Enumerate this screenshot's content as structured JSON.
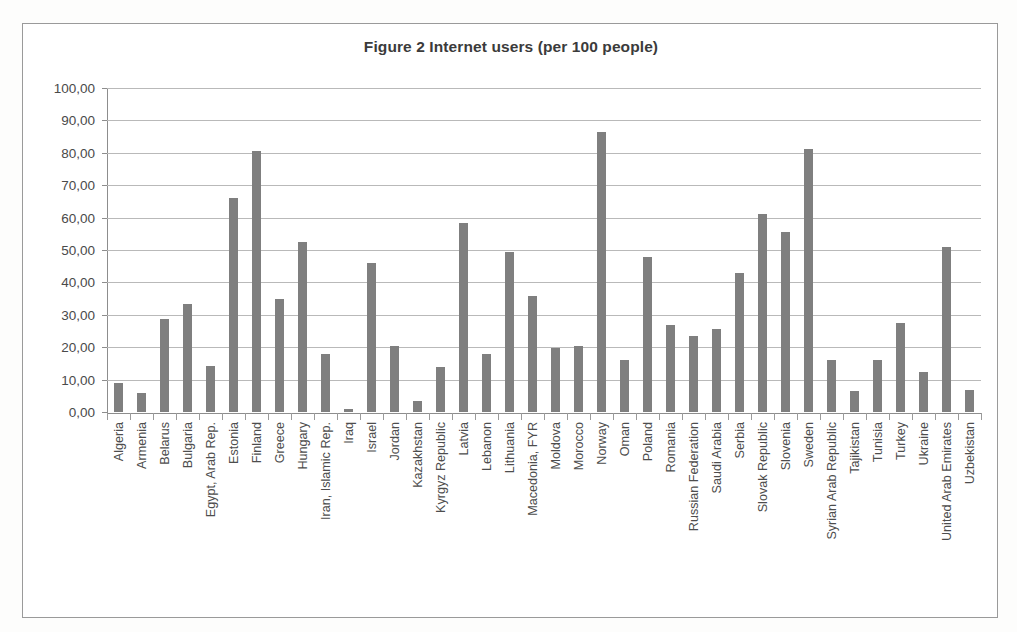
{
  "chart_data": {
    "type": "bar",
    "title": "Figure 2 Internet users (per 100 people)",
    "xlabel": "",
    "ylabel": "",
    "ylim": [
      0,
      100
    ],
    "ytick_step": 10,
    "ytick_labels": [
      "100,00",
      "90,00",
      "80,00",
      "70,00",
      "60,00",
      "50,00",
      "40,00",
      "30,00",
      "20,00",
      "10,00",
      "0,00"
    ],
    "grid": true,
    "legend": "none",
    "bar_color": "#7f7f7f",
    "gridline_color": "#b9b9b9",
    "axis_color": "#8d8d8d",
    "decimal_separator": ",",
    "categories": [
      "Algeria",
      "Armenia",
      "Belarus",
      "Bulgaria",
      "Egypt, Arab Rep.",
      "Estonia",
      "Finland",
      "Greece",
      "Hungary",
      "Iran, Islamic Rep.",
      "Iraq",
      "Israel",
      "Jordan",
      "Kazakhstan",
      "Kyrgyz Republic",
      "Latvia",
      "Lebanon",
      "Lithuania",
      "Macedonia, FYR",
      "Moldova",
      "Morocco",
      "Norway",
      "Oman",
      "Poland",
      "Romania",
      "Russian Federation",
      "Saudi Arabia",
      "Serbia",
      "Slovak Republic",
      "Slovenia",
      "Sweden",
      "Syrian Arab Republic",
      "Tajikistan",
      "Tunisia",
      "Turkey",
      "Ukraine",
      "United Arab Emirates",
      "Uzbekistan"
    ],
    "values": [
      9.1,
      5.8,
      28.6,
      33.2,
      14.3,
      66.0,
      80.5,
      35.0,
      52.5,
      17.8,
      1.0,
      45.9,
      20.4,
      3.3,
      13.8,
      58.4,
      18.0,
      49.3,
      35.7,
      19.9,
      20.5,
      86.5,
      16.0,
      47.8,
      27.0,
      23.6,
      25.5,
      43.0,
      61.0,
      55.5,
      81.3,
      16.0,
      6.5,
      16.1,
      27.6,
      12.5,
      50.8,
      6.8
    ]
  }
}
